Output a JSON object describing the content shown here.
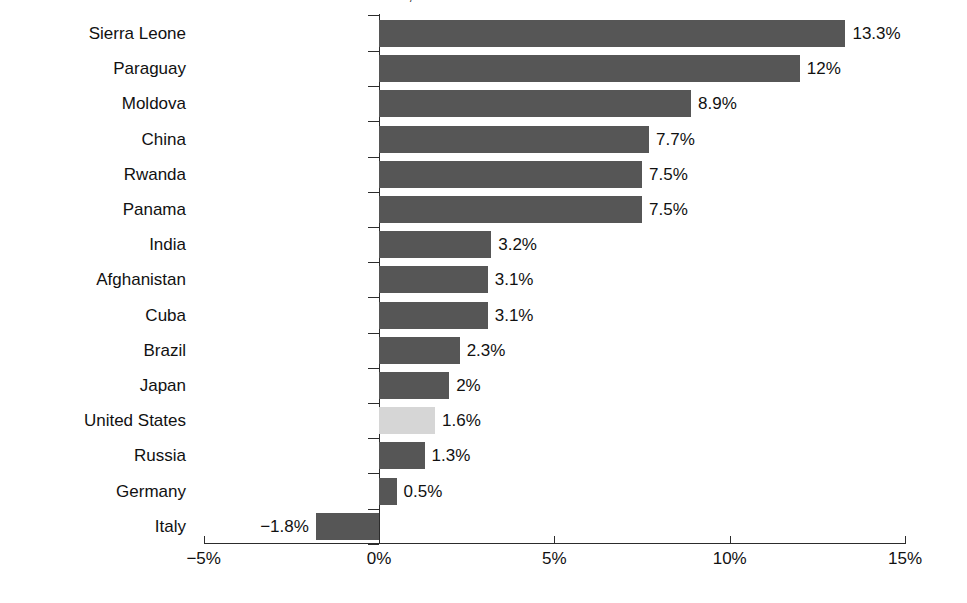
{
  "title_partial": "Inflation rate: selected countries, 2023",
  "chart_data": {
    "type": "bar",
    "orientation": "horizontal",
    "title": "",
    "xlabel": "",
    "ylabel": "",
    "xlim": [
      -5,
      15
    ],
    "xticks": [
      "-5%",
      "0%",
      "5%",
      "10%",
      "15%"
    ],
    "xtick_values": [
      -5,
      0,
      5,
      10,
      15
    ],
    "grid": false,
    "legend": "none",
    "categories": [
      "Sierra Leone",
      "Paraguay",
      "Moldova",
      "China",
      "Rwanda",
      "Panama",
      "India",
      "Afghanistan",
      "Cuba",
      "Brazil",
      "Japan",
      "United States",
      "Russia",
      "Germany",
      "Italy"
    ],
    "values": [
      13.3,
      12,
      8.9,
      7.7,
      7.5,
      7.5,
      3.2,
      3.1,
      3.1,
      2.3,
      2,
      1.6,
      1.3,
      0.5,
      -1.8
    ],
    "value_labels": [
      "13.3%",
      "12%",
      "8.9%",
      "7.7%",
      "7.5%",
      "7.5%",
      "3.2%",
      "3.1%",
      "3.1%",
      "2.3%",
      "2%",
      "1.6%",
      "1.3%",
      "0.5%",
      "−1.8%"
    ],
    "highlighted_category": "United States",
    "colors": {
      "bar": "#565656",
      "bar_highlight": "#d6d6d6",
      "axis": "#2c2c2c",
      "text": "#111111",
      "background": "#ffffff"
    }
  }
}
